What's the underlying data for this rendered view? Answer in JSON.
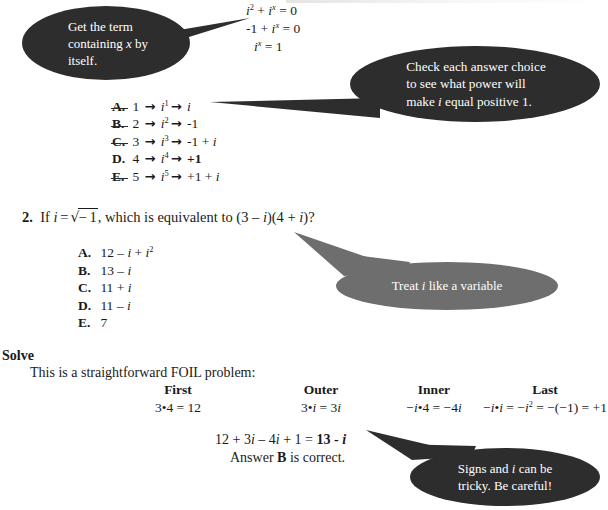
{
  "document": {
    "title": "ACT Math - Imaginary Numbers Worked Example",
    "background_color": "#ffffff",
    "text_color": "#1a1a1a"
  },
  "colors": {
    "callout_dark": "#2d2d2d",
    "callout_gray": "#6e6e6e",
    "callout_text": "#ffffff"
  },
  "equations_top": {
    "line1": "i² + iˣ = 0",
    "line2": "-1 + iˣ = 0",
    "line3": "iˣ = 1",
    "line1_parts": {
      "base": "i",
      "exp": "2",
      "plus": " + ",
      "base2": "i",
      "exp2": "x",
      "eq": " = 0"
    },
    "line2_parts": {
      "lead": "-1 + ",
      "base": "i",
      "exp": "x",
      "eq": " = 0"
    },
    "line3_parts": {
      "base": "i",
      "exp": "x",
      "eq": " = 1"
    }
  },
  "callouts": [
    {
      "id": "get-term",
      "style": "dark",
      "text": "Get the term containing x by itself.",
      "line1": "Get the term",
      "line2": "containing x by",
      "line3": "itself.",
      "points_to": "equations-top"
    },
    {
      "id": "check-answers",
      "style": "dark",
      "text": "Check each answer choice to see what power will make i equal positive 1.",
      "line1": "Check each answer choice",
      "line2": "to see what power will",
      "line3": "make i equal positive 1.",
      "points_to": "q1-choice-a"
    },
    {
      "id": "treat-variable",
      "style": "gray",
      "text": "Treat i like a variable",
      "points_to": "q2-stem"
    },
    {
      "id": "signs-tricky",
      "style": "dark",
      "text": "Signs and i can be tricky.  Be careful!",
      "line1": "Signs and i can be",
      "line2": "tricky.  Be careful!",
      "points_to": "final-equation"
    }
  ],
  "question1": {
    "choices": [
      {
        "label": "A.",
        "struck": true,
        "bold_result": false,
        "power_input": "1",
        "power_expr": "i¹",
        "result": "i"
      },
      {
        "label": "B.",
        "struck": true,
        "bold_result": false,
        "power_input": "2",
        "power_expr": "i²",
        "result": "-1"
      },
      {
        "label": "C.",
        "struck": true,
        "bold_result": false,
        "power_input": "3",
        "power_expr": "i³",
        "result": "-1 + i"
      },
      {
        "label": "D.",
        "struck": false,
        "bold_result": true,
        "power_input": "4",
        "power_expr": "i⁴",
        "result": "+1"
      },
      {
        "label": "E.",
        "struck": true,
        "bold_result": false,
        "power_input": "5",
        "power_expr": "i⁵",
        "result": "+1 + i"
      }
    ],
    "arrow_glyph": "→"
  },
  "question2": {
    "number": "2.",
    "stem_prefix": "If i =",
    "stem_radical": "− 1",
    "stem_suffix": ", which is equivalent to (3 – i)(4 + i)?",
    "full_stem": "2. If i = √−1, which is equivalent to (3 – i)(4 + i)?",
    "choices": [
      {
        "label": "A.",
        "text": "12 – i + i²"
      },
      {
        "label": "B.",
        "text": "13 – i"
      },
      {
        "label": "C.",
        "text": "11 + i"
      },
      {
        "label": "D.",
        "text": "11 – i"
      },
      {
        "label": "E.",
        "text": "7"
      }
    ]
  },
  "solve": {
    "heading": "Solve",
    "intro": "This is a straightforward FOIL problem:",
    "foil": [
      {
        "title": "First",
        "expr": "3•4 = 12"
      },
      {
        "title": "Outer",
        "expr": "3•i = 3i"
      },
      {
        "title": "Inner",
        "expr": "−i•4 = −4i"
      },
      {
        "title": "Last",
        "expr": "−i•i = −i² = −(−1) = +1"
      }
    ],
    "final_equation": "12 + 3i – 4i + 1 = 13 - i",
    "final_equation_lhs": "12 + 3i – 4i + 1 = ",
    "final_equation_rhs": "13 - i",
    "answer_prefix": "Answer ",
    "answer_letter": "B",
    "answer_suffix": " is correct."
  }
}
